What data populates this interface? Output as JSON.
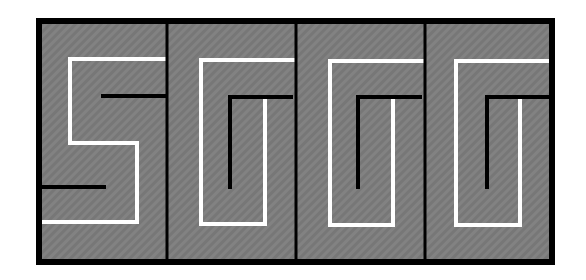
{
  "figure": {
    "colors": {
      "background": "#ffffff",
      "panel_fill": "#777777",
      "hatch": "#8a8a8a",
      "frame": "#000000",
      "white_path": "#ffffff",
      "black_path": "#000000"
    },
    "frame": {
      "x": 39,
      "y": 21,
      "width": 513,
      "height": 241,
      "stroke_width": 6
    },
    "dividers_x": [
      167,
      296,
      425
    ],
    "panels": [
      {
        "id": "panel-1",
        "shape": "S",
        "white_path": [
          [
            166,
            59
          ],
          [
            70,
            59
          ],
          [
            70,
            143
          ],
          [
            137,
            143
          ],
          [
            137,
            222
          ],
          [
            42,
            222
          ]
        ],
        "black_paths": [
          [
            [
              101,
              96
            ],
            [
              166,
              96
            ]
          ],
          [
            [
              42,
              187
            ],
            [
              106,
              187
            ]
          ]
        ]
      },
      {
        "id": "panel-2",
        "shape": "G-spiral",
        "white_path": [
          [
            293,
            60
          ],
          [
            201,
            60
          ],
          [
            201,
            224
          ],
          [
            265,
            224
          ],
          [
            265,
            98
          ]
        ],
        "black_paths": [
          [
            [
              293,
              97
            ],
            [
              230,
              97
            ],
            [
              230,
              189
            ]
          ]
        ]
      },
      {
        "id": "panel-3",
        "shape": "G-spiral",
        "white_path": [
          [
            422,
            61
          ],
          [
            330,
            61
          ],
          [
            330,
            225
          ],
          [
            393,
            225
          ],
          [
            393,
            98
          ]
        ],
        "black_paths": [
          [
            [
              422,
              97
            ],
            [
              358,
              97
            ],
            [
              358,
              189
            ]
          ]
        ]
      },
      {
        "id": "panel-4",
        "shape": "G-spiral",
        "white_path": [
          [
            550,
            61
          ],
          [
            456,
            61
          ],
          [
            456,
            225
          ],
          [
            520,
            225
          ],
          [
            520,
            98
          ]
        ],
        "black_paths": [
          [
            [
              550,
              97
            ],
            [
              487,
              97
            ],
            [
              487,
              189
            ]
          ]
        ]
      }
    ]
  }
}
